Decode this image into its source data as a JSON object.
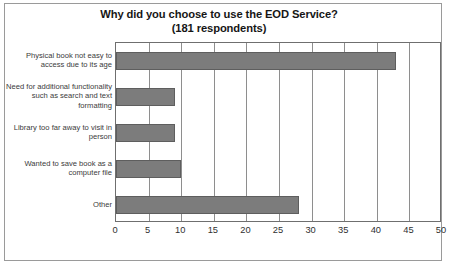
{
  "chart_data": {
    "type": "bar",
    "orientation": "horizontal",
    "title": "Why did you choose to use the EOD Service?",
    "subtitle": "(181 respondents)",
    "xlabel": "",
    "ylabel": "",
    "xlim": [
      0,
      50
    ],
    "xticks": [
      0,
      5,
      10,
      15,
      20,
      25,
      30,
      35,
      40,
      45,
      50
    ],
    "grid": "vertical",
    "legend": "none",
    "categories": [
      "Physical book not easy to access due to its age",
      "Need for additional functionality such as search and text formatting",
      "Library too far away to visit in person",
      "Wanted to save book as a computer file",
      "Other"
    ],
    "values": [
      43,
      9,
      9,
      10,
      28
    ],
    "bar_color": "#7c7c7c",
    "bar_border_color": "#5e5e5e",
    "plot_border_color": "#6f6f6f",
    "grid_color": "#8e8e8e",
    "background_color": "#ffffff",
    "frame_color": "#9a9a9a",
    "title_color": "#161616",
    "label_color": "#3b3b3b",
    "tick_color": "#2f2f2f"
  }
}
